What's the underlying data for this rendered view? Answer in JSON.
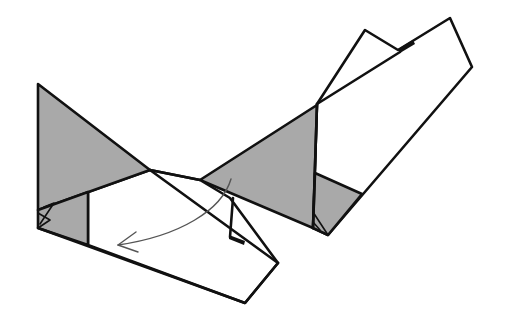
{
  "diagram": {
    "colors": {
      "background": "#ffffff",
      "outline": "#111111",
      "shaded_side": "#a9a9a9",
      "arrow": "#555555"
    },
    "left_model": {
      "label": "Folded paper model (view before fold)",
      "shaded_regions": 2
    },
    "right_model": {
      "label": "Folded paper model (second view)",
      "shaded_regions": 2
    },
    "fold_arrow": {
      "label": "Curved fold arrow",
      "direction": "down-left"
    }
  }
}
